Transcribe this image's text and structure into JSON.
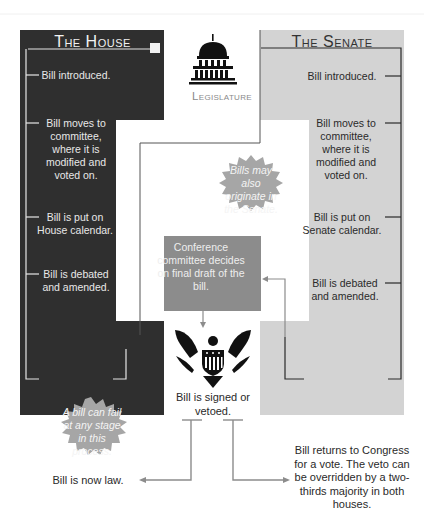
{
  "colors": {
    "house_panel": "#2f2f2f",
    "senate_panel": "#d3d3d3",
    "conference_box": "#8c8c8c",
    "burst": "#a6a6a6",
    "house_line": "#e6e6e6",
    "senate_line": "#2a2a2a",
    "arrow_line": "#8c8c8c"
  },
  "house": {
    "title": "The House",
    "steps": [
      "Bill introduced.",
      "Bill moves to committee, where it is modified and voted on.",
      "Bill is put on House calendar.",
      "Bill is debated and amended."
    ]
  },
  "senate": {
    "title": "The Senate",
    "steps": [
      "Bill introduced.",
      "Bill moves to committee, where it is modified and voted on.",
      "Bill is put on Senate calendar.",
      "Bill is debated and amended."
    ]
  },
  "legislature": {
    "label": "Legislature",
    "icon": "capitol-building-icon"
  },
  "senate_origin_note": "Bills may also originate in the Senate.",
  "conference": {
    "text": "Conference committee decides on final draft of the bill."
  },
  "executive": {
    "icon": "eagle-seal-icon",
    "text": "Bill is signed or vetoed."
  },
  "fail_note": "A bill can fail at any stage in this process.",
  "outcomes": {
    "law": "Bill is now law.",
    "veto": "Bill returns to Congress for a vote. The veto can be overridden by a two-thirds majority in both houses."
  }
}
